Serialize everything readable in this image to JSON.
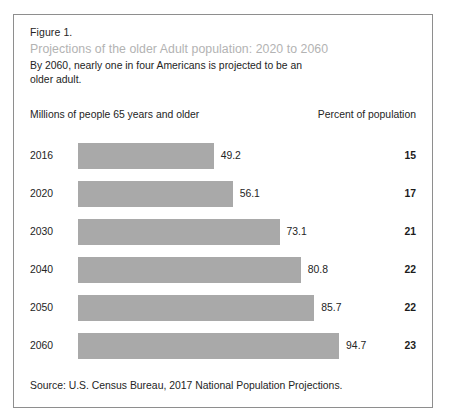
{
  "figure": {
    "number_label": "Figure 1.",
    "title": "Projections of the older Adult population: 2020 to 2060",
    "subtitle": "By 2060, nearly one in four Americans is projected to be an older adult.",
    "left_axis_label": "Millions of people 65 years and older",
    "right_axis_label": "Percent of population",
    "source": "Source: U.S. Census Bureau, 2017 National Population Projections.",
    "artifact_text": "",
    "colors": {
      "bar": "#a9a9a9",
      "frame_border": "#8e8e8e",
      "title_text": "#b3b3b3",
      "body_text": "#242424",
      "background": "#ffffff"
    }
  },
  "chart_data": {
    "type": "bar",
    "orientation": "horizontal",
    "title": "Projections of the older Adult population: 2020 to 2060",
    "subtitle": "By 2060, nearly one in four Americans is projected to be an older adult.",
    "xlabel": "Millions of people 65 years and older",
    "ylabel": "",
    "grid": false,
    "legend": false,
    "xlim": [
      0,
      94.7
    ],
    "categories": [
      "2016",
      "2020",
      "2030",
      "2040",
      "2050",
      "2060"
    ],
    "values": [
      49.2,
      56.1,
      73.1,
      80.8,
      85.7,
      94.7
    ],
    "series": [
      {
        "name": "Millions of people 65 years and older",
        "values": [
          49.2,
          56.1,
          73.1,
          80.8,
          85.7,
          94.7
        ]
      },
      {
        "name": "Percent of population",
        "values": [
          15,
          17,
          21,
          22,
          22,
          23
        ]
      }
    ],
    "rows": [
      {
        "year": "2016",
        "millions": "49.2",
        "percent": "15",
        "value": 49.2
      },
      {
        "year": "2020",
        "millions": "56.1",
        "percent": "17",
        "value": 56.1
      },
      {
        "year": "2030",
        "millions": "73.1",
        "percent": "21",
        "value": 73.1
      },
      {
        "year": "2040",
        "millions": "80.8",
        "percent": "22",
        "value": 80.8
      },
      {
        "year": "2050",
        "millions": "85.7",
        "percent": "22",
        "value": 85.7
      },
      {
        "year": "2060",
        "millions": "94.7",
        "percent": "23",
        "value": 94.7
      }
    ],
    "source": "Source: U.S. Census Bureau, 2017 National Population Projections."
  },
  "layout": {
    "bar_origin_x": 64,
    "bar_scale_px_per_unit": 2.757,
    "first_row_top": 128,
    "row_pitch": 38,
    "bar_height": 26,
    "value_gap": 7
  }
}
